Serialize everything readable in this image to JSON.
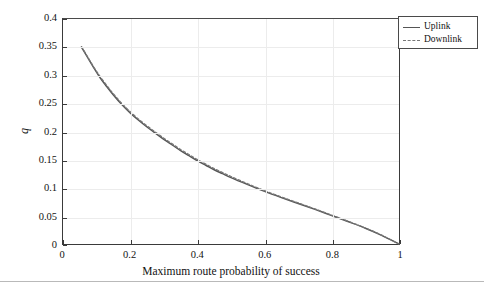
{
  "figure": {
    "background_color": "#ffffff",
    "frame_color": "#3a3a3a",
    "grid_color": "#ececec",
    "has_bottom_rule": true
  },
  "legend": {
    "position": "top-right",
    "entries": [
      {
        "label": "Uplink",
        "style": "solid",
        "color": "#555555"
      },
      {
        "label": "Downlink",
        "style": "dashed",
        "color": "#777777"
      }
    ]
  },
  "chart_data": {
    "type": "line",
    "title": "",
    "subtitle": "",
    "xlabel": "Maximum route probability of success",
    "ylabel": "q",
    "xlim": [
      0,
      1
    ],
    "ylim": [
      0,
      0.4
    ],
    "xticks": [
      0,
      0.2,
      0.4,
      0.6,
      0.8,
      1
    ],
    "xticklabels": [
      "0",
      "0.2",
      "0.4",
      "0.6",
      "0.8",
      "1"
    ],
    "yticks": [
      0,
      0.05,
      0.1,
      0.15,
      0.2,
      0.25,
      0.3,
      0.35,
      0.4
    ],
    "yticklabels": [
      "0",
      "0.05",
      "0.1",
      "0.15",
      "0.2",
      "0.25",
      "0.3",
      "0.35",
      "0.4"
    ],
    "grid": true,
    "legend_position": "upper right",
    "annotations": [],
    "series": [
      {
        "name": "Uplink",
        "style": "solid",
        "color": "#555555",
        "x": [
          0.055,
          0.07,
          0.09,
          0.11,
          0.13,
          0.15,
          0.175,
          0.2,
          0.225,
          0.25,
          0.275,
          0.3,
          0.325,
          0.35,
          0.375,
          0.4,
          0.425,
          0.45,
          0.475,
          0.5,
          0.55,
          0.6,
          0.65,
          0.7,
          0.75,
          0.8,
          0.85,
          0.9,
          0.95,
          1.0
        ],
        "y": [
          0.35,
          0.335,
          0.315,
          0.296,
          0.28,
          0.265,
          0.248,
          0.233,
          0.22,
          0.208,
          0.197,
          0.186,
          0.176,
          0.166,
          0.157,
          0.148,
          0.14,
          0.132,
          0.125,
          0.118,
          0.1055,
          0.0935,
          0.0825,
          0.072,
          0.0615,
          0.0505,
          0.0395,
          0.028,
          0.015,
          0.0
        ]
      },
      {
        "name": "Downlink",
        "style": "dashed",
        "color": "#777777",
        "x": [
          0.055,
          0.07,
          0.09,
          0.11,
          0.13,
          0.15,
          0.175,
          0.2,
          0.225,
          0.25,
          0.275,
          0.3,
          0.325,
          0.35,
          0.375,
          0.4,
          0.425,
          0.45,
          0.475,
          0.5,
          0.55,
          0.6,
          0.65,
          0.7,
          0.75,
          0.8,
          0.85,
          0.9,
          0.95,
          1.0
        ],
        "y": [
          0.351,
          0.336,
          0.316,
          0.298,
          0.282,
          0.267,
          0.25,
          0.235,
          0.222,
          0.21,
          0.199,
          0.188,
          0.178,
          0.168,
          0.159,
          0.15,
          0.142,
          0.134,
          0.127,
          0.12,
          0.107,
          0.0948,
          0.0836,
          0.073,
          0.0623,
          0.0512,
          0.04,
          0.0284,
          0.0152,
          0.0
        ]
      }
    ]
  }
}
